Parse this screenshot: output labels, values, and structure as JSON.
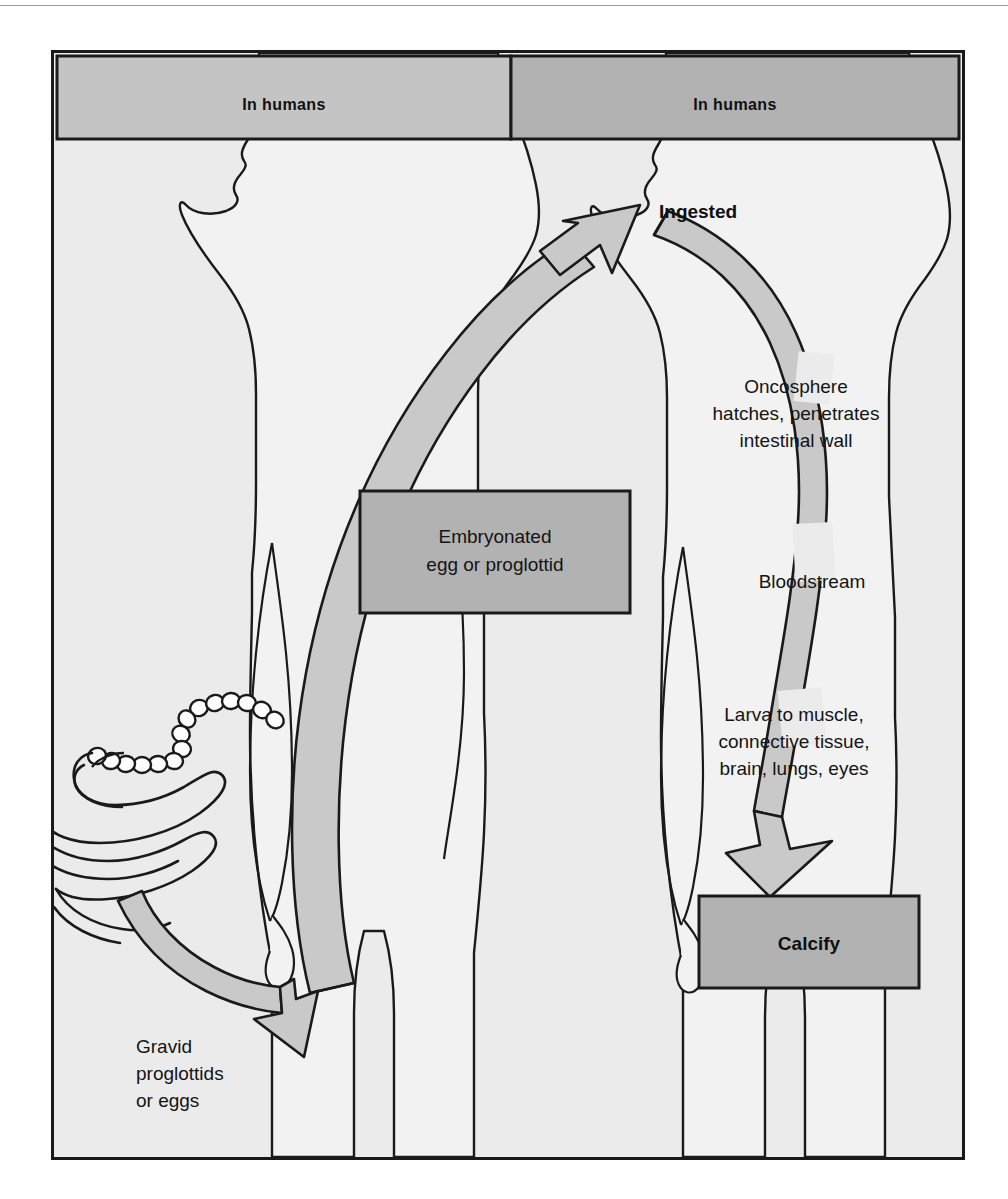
{
  "figure": {
    "background_color": "#ebebeb",
    "frame_color": "#1a1a1a",
    "ribbon_color": "#c9c9c9",
    "box_fill_light": "#c4c4c4",
    "box_fill_dark": "#b2b2b2",
    "figure_fill": "#f2f2f2"
  },
  "headers": [
    {
      "id": "left",
      "label": "In humans",
      "fill": "#c4c4c4"
    },
    {
      "id": "right",
      "label": "In humans",
      "fill": "#b2b2b2"
    }
  ],
  "boxes": [
    {
      "id": "embryonated",
      "line1": "Embryonated",
      "line2": "egg or proglottid",
      "bold": false,
      "fill": "#b2b2b2"
    },
    {
      "id": "calcify",
      "line1": "Calcify",
      "line2": "",
      "bold": true,
      "fill": "#b2b2b2"
    }
  ],
  "labels": {
    "ingested": "Ingested",
    "oncosphere": {
      "line1": "Oncosphere",
      "line2": "hatches, penetrates",
      "line3": "intestinal wall"
    },
    "bloodstream": "Bloodstream",
    "larva": {
      "line1": "Larva to muscle,",
      "line2": "connective tissue,",
      "line3": "brain, lungs, eyes"
    },
    "gravid": {
      "line1": "Gravid",
      "line2": "proglottids",
      "line3": "or eggs"
    }
  },
  "icons": {
    "tapeworm": "tapeworm-icon",
    "human_left": "human-silhouette-icon",
    "human_right": "human-silhouette-icon",
    "arrow_up_to_mouth": "curved-arrow-up-icon",
    "arrow_down_to_calcify": "curved-arrow-down-icon",
    "arrow_to_ground": "curved-arrow-right-icon",
    "ribbon_egg_path": "ribbon-path-icon"
  }
}
